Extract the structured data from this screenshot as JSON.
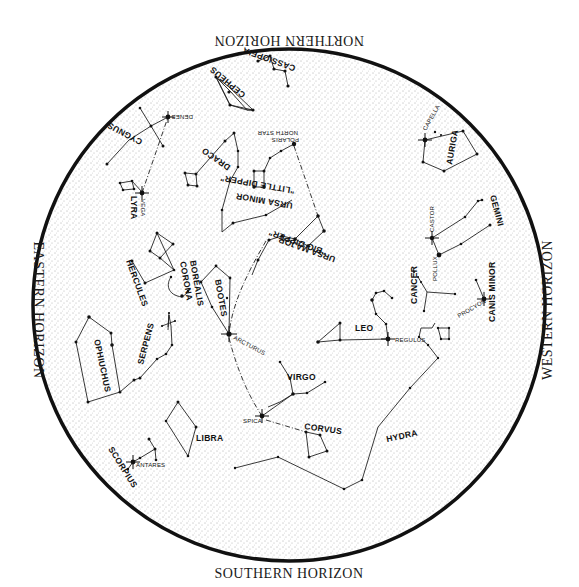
{
  "horizons": {
    "north": "NORTHERN HORIZON",
    "south": "SOUTHERN HORIZON",
    "east": "EASTERN HORIZON",
    "west": "WESTERN HORIZON"
  },
  "constellations": {
    "cassiopeia": "CASSIOPEIA",
    "cepheus": "CEPHEUS",
    "cygnus": "CYGNUS",
    "lyra": "LYRA",
    "draco": "DRACO",
    "ursa_minor": "URSA MINOR",
    "little_dipper": "\"LITTLE DIPPER\"",
    "ursa_major": "URSA MAJOR",
    "big_dipper": "\"BIG DIPPER\"",
    "hercules": "HERCULES",
    "corona": "CORONA",
    "borealis": "BOREALIS",
    "bootes": "BOOTES",
    "auriga": "AURIGA",
    "gemini": "GEMINI",
    "cancer": "CANCER",
    "canis_minor": "CANIS MINOR",
    "leo": "LEO",
    "ophiuchus": "OPHIUCHUS",
    "serpens": "SERPENS",
    "virgo": "VIRGO",
    "corvus": "CORVUS",
    "hydra": "HYDRA",
    "libra": "LIBRA",
    "scorpius": "SCORPIUS"
  },
  "stars": {
    "deneb": "DENEB",
    "vega": "VEGA",
    "polaris": "POLARIS",
    "north_star": "NORTH STAR",
    "capella": "CAPELLA",
    "castor": "CASTOR",
    "pollux": "POLLUX",
    "procyon": "PROCYON",
    "regulus": "REGULUS",
    "arcturus": "ARCTURUS",
    "spica": "SPICA",
    "antares": "ANTARES"
  },
  "colors": {
    "ink": "#111111",
    "background": "#ffffff",
    "stipple": "#555555"
  }
}
